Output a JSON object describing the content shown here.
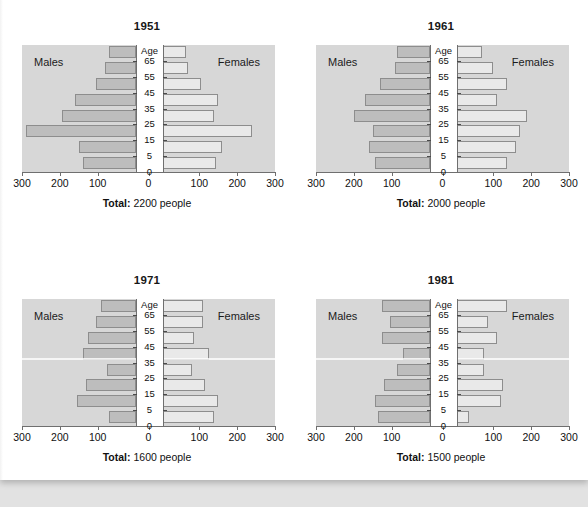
{
  "figure": {
    "background_color": "#ffffff",
    "plot_background_color": "#d7d7d7",
    "male_bar_color": "#bdbdbd",
    "female_bar_color": "#e9e9e9",
    "bar_border_color": "#8d8d8d"
  },
  "labels": {
    "males": "Males",
    "females": "Females",
    "age_header": "Age",
    "total_prefix": "Total:"
  },
  "axis": {
    "age_ticks": [
      "65",
      "55",
      "45",
      "35",
      "25",
      "15",
      "5",
      "0"
    ],
    "x_ticks": [
      "300",
      "200",
      "100",
      "0",
      "100",
      "200",
      "300"
    ],
    "x_min": 0,
    "x_max": 300
  },
  "chart_data": {
    "type": "bar",
    "xlabel": "",
    "ylabel": "Age",
    "xlim": [
      0,
      300
    ],
    "grid": false,
    "legend": [
      "Males",
      "Females"
    ],
    "age_groups": [
      "70+",
      "65",
      "55",
      "45",
      "35",
      "25",
      "15",
      "5"
    ],
    "panels": [
      {
        "year": "1951",
        "total_value": "2200",
        "total_units": "people",
        "total_text": "2200 people",
        "males": [
          70,
          80,
          105,
          160,
          195,
          290,
          150,
          140
        ],
        "females": [
          65,
          70,
          105,
          150,
          140,
          240,
          160,
          145
        ]
      },
      {
        "year": "1961",
        "total_value": "2000",
        "total_units": "people",
        "total_text": "2000 people",
        "males": [
          85,
          90,
          130,
          170,
          200,
          150,
          160,
          145
        ],
        "females": [
          70,
          100,
          135,
          110,
          190,
          170,
          160,
          135
        ]
      },
      {
        "year": "1971",
        "total_value": "1600",
        "total_units": "people",
        "total_text": "1600 people",
        "males": [
          90,
          105,
          125,
          140,
          75,
          130,
          155,
          70
        ],
        "females": [
          110,
          110,
          85,
          125,
          80,
          115,
          150,
          140
        ]
      },
      {
        "year": "1981",
        "total_value": "1500",
        "total_units": "people",
        "total_text": "1500 people",
        "males": [
          125,
          105,
          125,
          70,
          85,
          120,
          145,
          135
        ],
        "females": [
          135,
          85,
          110,
          75,
          75,
          125,
          120,
          35
        ]
      }
    ]
  }
}
